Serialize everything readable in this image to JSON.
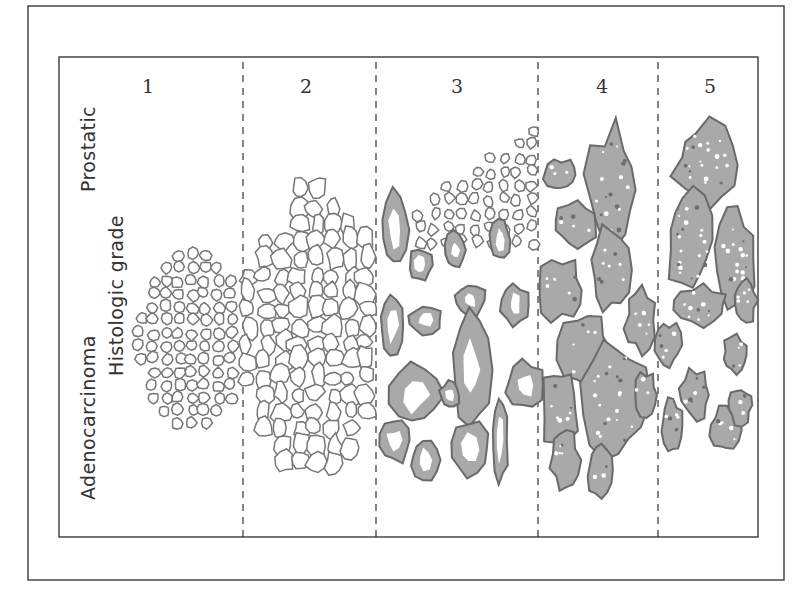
{
  "figure": {
    "title_lines": [
      "Prostatic",
      "Histologic grade",
      "Adenocarcinoma"
    ],
    "title_line_1_part_a": "Adenocarcinoma",
    "title_line_1_part_b": "Prostatic",
    "title_line_2": "Histologic grade",
    "colors": {
      "frame": "#3a3a3a",
      "gland_outline": "#777777",
      "tumor_fill": "#a9a9a9",
      "tumor_outline": "#6a6a6a",
      "lumen": "#ffffff"
    }
  },
  "grades": [
    {
      "label": "1",
      "pattern": "small uniform closely packed glands",
      "fill": false,
      "density": "high"
    },
    {
      "label": "2",
      "pattern": "larger, more loosely arranged glands",
      "fill": false,
      "density": "medium"
    },
    {
      "label": "3",
      "pattern": "irregular, infiltrating glands of varied size",
      "fill": true,
      "density": "medium"
    },
    {
      "label": "4",
      "pattern": "fused glands forming cords and sheets",
      "fill": true,
      "density": "high"
    },
    {
      "label": "5",
      "pattern": "solid sheets with rare lumina",
      "fill": true,
      "density": "high"
    }
  ]
}
